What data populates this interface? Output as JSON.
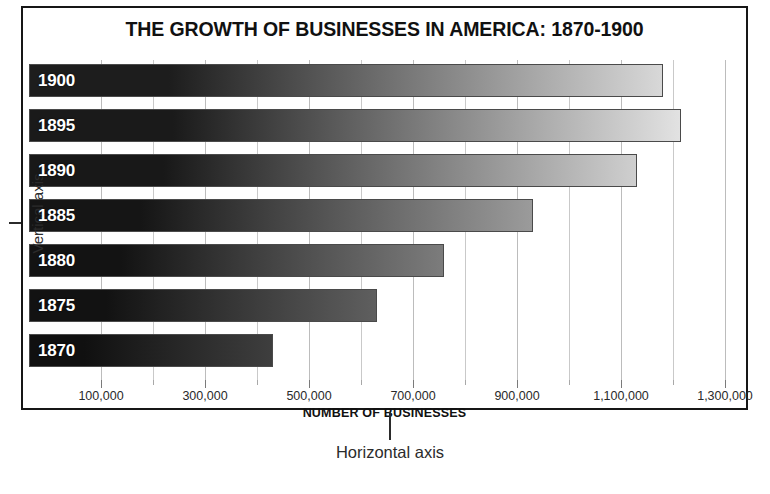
{
  "chart_data": {
    "type": "bar",
    "orientation": "horizontal",
    "title": "THE GROWTH OF BUSINESSES IN AMERICA: 1870-1900",
    "xlabel": "NUMBER OF BUSINESSES",
    "ylabel": "",
    "categories": [
      "1900",
      "1895",
      "1890",
      "1885",
      "1880",
      "1875",
      "1870"
    ],
    "values": [
      1180000,
      1215000,
      1130000,
      930000,
      760000,
      630000,
      430000
    ],
    "xlim": [
      0,
      1350000
    ],
    "xticks": [
      100000,
      300000,
      500000,
      700000,
      900000,
      1100000,
      1300000
    ],
    "xtick_labels": [
      "100,000",
      "300,000",
      "500,000",
      "700,000",
      "900,000",
      "1,100,000",
      "1,300,000"
    ],
    "xminor_ticks": [
      200000,
      400000,
      600000,
      800000,
      1000000,
      1200000
    ],
    "grid": true,
    "legend": null,
    "bars": [
      {
        "category": "1900",
        "value": 1180000,
        "fill_start": "#1d1d1d",
        "fill_end": "#d8d8d8"
      },
      {
        "category": "1895",
        "value": 1215000,
        "fill_start": "#1a1a1a",
        "fill_end": "#e2e2e2"
      },
      {
        "category": "1890",
        "value": 1130000,
        "fill_start": "#181818",
        "fill_end": "#cfcfcf"
      },
      {
        "category": "1885",
        "value": 930000,
        "fill_start": "#151515",
        "fill_end": "#9b9b9b"
      },
      {
        "category": "1880",
        "value": 760000,
        "fill_start": "#131313",
        "fill_end": "#7c7c7c"
      },
      {
        "category": "1875",
        "value": 630000,
        "fill_start": "#121212",
        "fill_end": "#5f5f5f"
      },
      {
        "category": "1870",
        "value": 430000,
        "fill_start": "#101010",
        "fill_end": "#3e3e3e"
      }
    ]
  },
  "annotations": {
    "vertical_axis": "Vertical axis",
    "horizontal_axis": "Horizontal axis"
  },
  "colors": {
    "frame": "#161616",
    "gridline": "#c9c9c9",
    "bar_border": "#4a4a4a",
    "text": "#111111",
    "annotation_text": "#2b2b2b"
  }
}
